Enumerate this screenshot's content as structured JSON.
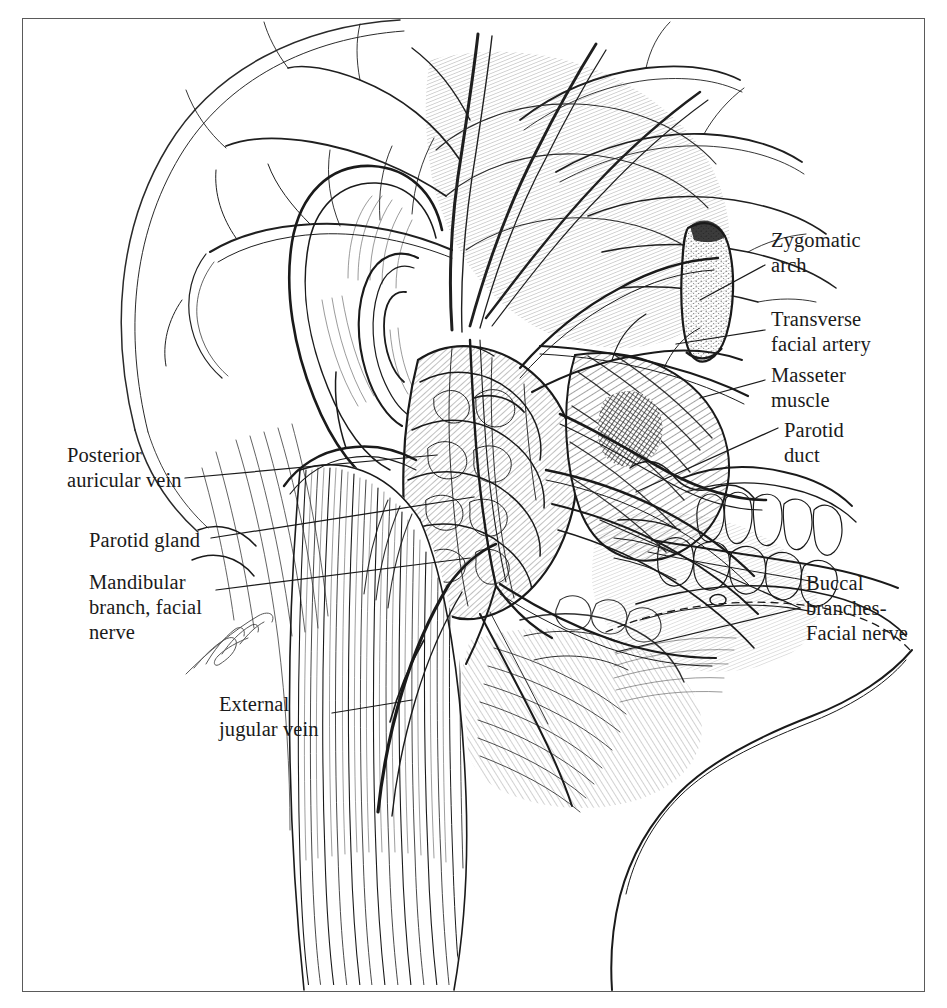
{
  "figure": {
    "domain_note": "pen-and-ink anatomical plate",
    "background_color": "#ffffff",
    "ink_color": "#1a1a1a",
    "frame_color": "#5a5a5a",
    "frame": {
      "x": 22,
      "y": 18,
      "width": 903,
      "height": 974
    },
    "signature": "artist signature"
  },
  "labels": [
    {
      "id": "zygomatic-arch",
      "text": "Zygomatic\narch",
      "side": "right",
      "x": 771,
      "y": 228,
      "leader": {
        "x1": 765,
        "y1": 265,
        "x2": 700,
        "y2": 300
      }
    },
    {
      "id": "transverse-facial-artery",
      "text": "Transverse\nfacial artery",
      "side": "right",
      "x": 771,
      "y": 307,
      "leader": {
        "x1": 765,
        "y1": 330,
        "x2": 676,
        "y2": 344
      }
    },
    {
      "id": "masseter-muscle",
      "text": "Masseter\nmuscle",
      "side": "right",
      "x": 771,
      "y": 363,
      "leader": {
        "x1": 765,
        "y1": 380,
        "x2": 700,
        "y2": 398
      }
    },
    {
      "id": "parotid-duct",
      "text": "Parotid\nduct",
      "side": "right",
      "x": 784,
      "y": 418,
      "leader": {
        "x1": 778,
        "y1": 428,
        "x2": 636,
        "y2": 492
      }
    },
    {
      "id": "buccal-branches-facial-nerve",
      "text": "Buccal\nbranches-\nFacial nerve",
      "side": "right",
      "x": 806,
      "y": 571,
      "leader": {
        "x1": 800,
        "y1": 608,
        "x2": 600,
        "y2": 520
      }
    },
    {
      "id": "posterior-auricular-vein",
      "text": "Posterior\nauricular vein",
      "side": "left",
      "x": 67,
      "y": 443,
      "leader": {
        "x1": 185,
        "y1": 478,
        "x2": 437,
        "y2": 455
      }
    },
    {
      "id": "parotid-gland",
      "text": "Parotid gland",
      "side": "left",
      "x": 89,
      "y": 528,
      "leader": {
        "x1": 211,
        "y1": 538,
        "x2": 474,
        "y2": 497
      }
    },
    {
      "id": "mandibular-branch-facial-nerve",
      "text": "Mandibular\nbranch, facial\nnerve",
      "side": "left",
      "x": 89,
      "y": 570,
      "leader": {
        "x1": 216,
        "y1": 590,
        "x2": 470,
        "y2": 558
      }
    },
    {
      "id": "external-jugular-vein",
      "text": "External\njugular vein",
      "side": "left",
      "x": 219,
      "y": 692,
      "leader": {
        "x1": 332,
        "y1": 713,
        "x2": 412,
        "y2": 700
      }
    }
  ],
  "structures": [
    {
      "id": "scalp-outline",
      "name": "cranial vault outline"
    },
    {
      "id": "superficial-temporal-vessels",
      "name": "superficial temporal artery and vein branches"
    },
    {
      "id": "auricle",
      "name": "external ear (auricle)"
    },
    {
      "id": "temporalis-fascia",
      "name": "temporal fascia"
    },
    {
      "id": "zygomatic-arch-stump",
      "name": "cut zygomatic arch"
    },
    {
      "id": "masseter",
      "name": "masseter muscle"
    },
    {
      "id": "parotid-gland-body",
      "name": "parotid gland"
    },
    {
      "id": "parotid-duct-course",
      "name": "parotid (Stensen's) duct"
    },
    {
      "id": "facial-nerve-branches",
      "name": "branches of the facial nerve"
    },
    {
      "id": "orbicularis-oris",
      "name": "orbicularis oris / lips"
    },
    {
      "id": "mandible-body",
      "name": "body of the mandible"
    },
    {
      "id": "sternocleidomastoid",
      "name": "sternocleidomastoid muscle"
    },
    {
      "id": "platysma",
      "name": "platysma"
    },
    {
      "id": "external-jugular-vessel",
      "name": "external jugular vein"
    }
  ]
}
